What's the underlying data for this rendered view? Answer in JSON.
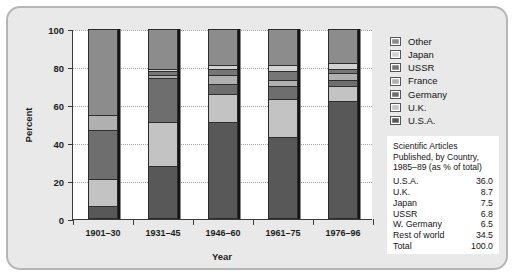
{
  "chart_data": {
    "type": "bar",
    "subtype": "stacked-100-percent",
    "title": "",
    "xlabel": "Year",
    "ylabel": "Percent",
    "ylim": [
      0,
      100
    ],
    "yticks": [
      0,
      20,
      40,
      60,
      80,
      100
    ],
    "grid": true,
    "legend_position": "right",
    "categories": [
      "1901–30",
      "1931–45",
      "1946–60",
      "1961–75",
      "1976–96"
    ],
    "series": [
      {
        "name": "U.S.A.",
        "color": "#585858",
        "values": [
          7,
          28,
          51,
          43,
          62
        ]
      },
      {
        "name": "U.K.",
        "color": "#c3c3c3",
        "values": [
          14,
          23,
          15,
          20,
          8
        ]
      },
      {
        "name": "Germany",
        "color": "#6e6e6e",
        "values": [
          26,
          23,
          5,
          7,
          3
        ]
      },
      {
        "name": "France",
        "color": "#b0b0b0",
        "values": [
          8,
          2,
          5,
          3,
          4
        ]
      },
      {
        "name": "USSR",
        "color": "#767676",
        "values": [
          0,
          2,
          3,
          5,
          2
        ]
      },
      {
        "name": "Japan",
        "color": "#d2d2d2",
        "values": [
          0,
          1,
          2,
          3,
          3
        ]
      },
      {
        "name": "Other",
        "color": "#8c8c8c",
        "values": [
          45,
          21,
          19,
          19,
          18
        ]
      }
    ],
    "legend_entries": [
      {
        "label": "Other",
        "color": "#8c8c8c"
      },
      {
        "label": "Japan",
        "color": "#d2d2d2"
      },
      {
        "label": "USSR",
        "color": "#767676"
      },
      {
        "label": "France",
        "color": "#b0b0b0"
      },
      {
        "label": "Germany",
        "color": "#6e6e6e"
      },
      {
        "label": "U.K.",
        "color": "#c3c3c3"
      },
      {
        "label": "U.S.A.",
        "color": "#585858"
      }
    ]
  },
  "table": {
    "title_lines": [
      "Scientific Articles",
      "Published, by Country,",
      "1985–89 (as % of total)"
    ],
    "rows": [
      {
        "label": "U.S.A.",
        "value": "36.0"
      },
      {
        "label": "U.K.",
        "value": "8.7"
      },
      {
        "label": "Japan",
        "value": "7.5"
      },
      {
        "label": "USSR",
        "value": "6.8"
      },
      {
        "label": "W. Germany",
        "value": "6.5"
      },
      {
        "label": "Rest of world",
        "value": "34.5"
      },
      {
        "label": "Total",
        "value": "100.0"
      }
    ]
  }
}
